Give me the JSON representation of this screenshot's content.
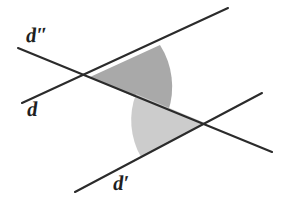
{
  "figure": {
    "background_color": "#ffffff",
    "line_color": "#2b2b2b",
    "width": 286,
    "height": 199,
    "labels": {
      "d_double_prime": "d″",
      "d": "d",
      "d_prime": "d′"
    },
    "lines": [
      {
        "name": "d″",
        "label": "d″",
        "start": [
          18,
          48
        ],
        "end": [
          272,
          152
        ],
        "label_position": [
          26,
          25
        ]
      },
      {
        "name": "d",
        "label": "d",
        "start": [
          22,
          103
        ],
        "end": [
          228,
          8
        ],
        "label_position": [
          27,
          99
        ]
      },
      {
        "name": "d′",
        "label": "d′",
        "start": [
          75,
          192
        ],
        "end": [
          262,
          93
        ],
        "label_position": [
          113,
          173
        ]
      }
    ],
    "intersections": [
      {
        "name": "upper-vertex",
        "point": [
          90,
          77
        ]
      },
      {
        "name": "lower-vertex",
        "point": [
          205,
          123
        ]
      }
    ],
    "sectors": [
      {
        "name": "upper-angle-sector",
        "vertex": [
          90,
          77
        ],
        "fill_color": "#a9a9a9",
        "radius": 78,
        "opens": "right"
      },
      {
        "name": "lower-angle-sector",
        "vertex": [
          205,
          123
        ],
        "fill_color": "#cccccc",
        "radius": 74,
        "opens": "left"
      }
    ]
  }
}
